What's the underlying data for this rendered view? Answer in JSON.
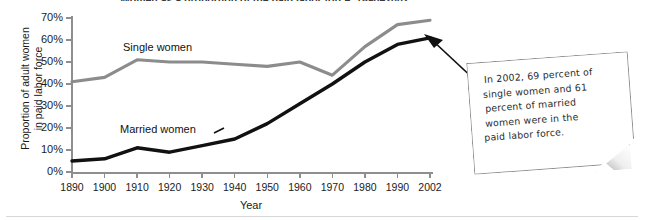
{
  "chart_data": {
    "type": "line",
    "title": "Women as a proportion of the paid labor force, 1890–2002",
    "xlabel": "Year",
    "ylabel_line1": "Proportion of adult women",
    "ylabel_line2": "in paid labor force",
    "x": [
      1890,
      1900,
      1910,
      1920,
      1930,
      1940,
      1950,
      1960,
      1970,
      1980,
      1990,
      2002
    ],
    "xtick_labels": [
      "1890",
      "1900",
      "1910",
      "1920",
      "1930",
      "1940",
      "1950",
      "1960",
      "1970",
      "1980",
      "1990",
      "2002"
    ],
    "ytick_labels": [
      "0%",
      "10%",
      "20%",
      "30%",
      "40%",
      "50%",
      "60%",
      "70%"
    ],
    "ytick_values": [
      0,
      10,
      20,
      30,
      40,
      50,
      60,
      70
    ],
    "ylim": [
      0,
      70
    ],
    "xlim": [
      1890,
      2002
    ],
    "grid": false,
    "legend_position": "in-plot",
    "series": [
      {
        "name": "Single women",
        "color": "#8c8c8c",
        "values": [
          41,
          43,
          51,
          50,
          50,
          49,
          48,
          50,
          44,
          57,
          67,
          69
        ]
      },
      {
        "name": "Married women",
        "color": "#111111",
        "values": [
          5,
          6,
          11,
          9,
          12,
          15,
          22,
          31,
          40,
          50,
          58,
          61
        ]
      }
    ],
    "annotations": [
      {
        "name": "callout-note",
        "text": "In 2002, 69 percent of single women and 61 percent of married women were in the paid labor force.",
        "lines": [
          "In 2002, 69 percent of",
          "single women and 61",
          "percent of married",
          "women were in the",
          "paid labor force."
        ],
        "points_to": "2002 endpoints"
      }
    ]
  },
  "chart": {
    "title": "Women as a proportion of the paid labor force, 1890–2002",
    "xlabel": "Year",
    "ylabel_line1": "Proportion of adult women",
    "ylabel_line2": "in paid labor force",
    "series_labels": {
      "single": "Single women",
      "married": "Married women"
    }
  },
  "colors": {
    "single_line": "#8c8c8c",
    "married_line": "#111111",
    "axis": "#8e8e8e",
    "text": "#1b1b1b",
    "callout_border": "#8d8d8d",
    "background": "#ffffff"
  }
}
